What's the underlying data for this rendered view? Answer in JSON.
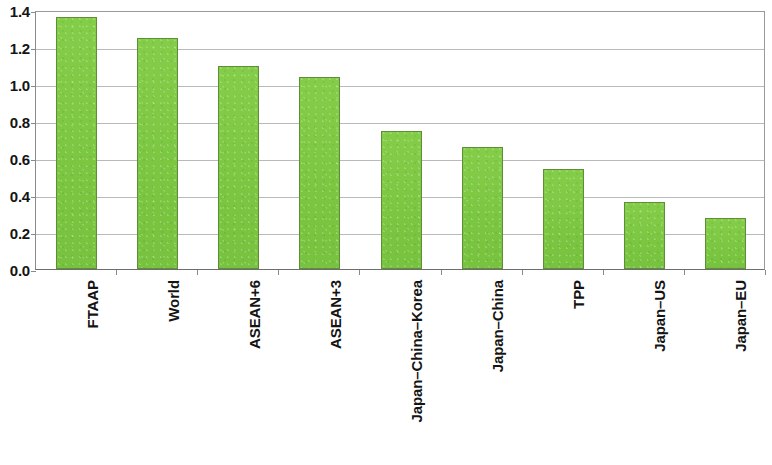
{
  "chart_data": {
    "type": "bar",
    "title": "",
    "subtitle": "",
    "xlabel": "",
    "ylabel": "",
    "categories": [
      "FTAAP",
      "World",
      "ASEAN+6",
      "ASEAN+3",
      "Japan–China–Korea",
      "Japan–China",
      "TPP",
      "Japan–US",
      "Japan–EU"
    ],
    "values": [
      1.36,
      1.25,
      1.1,
      1.04,
      0.745,
      0.66,
      0.54,
      0.36,
      0.275
    ],
    "ylim": [
      0.0,
      1.4
    ],
    "ytick_labels": [
      "0.0",
      "0.2",
      "0.4",
      "0.6",
      "0.8",
      "1.0",
      "1.2",
      "1.4"
    ],
    "ytick_values": [
      0.0,
      0.2,
      0.4,
      0.6,
      0.8,
      1.0,
      1.2,
      1.4
    ],
    "grid": true,
    "legend": false,
    "legend_position": "none",
    "bar_color": "#7ec943",
    "bar_border_color": "#5e8f36",
    "grid_color": "#b9b9b9",
    "axis_color": "#8a8a8a",
    "background_color": "#ffffff",
    "x_label_rotation_degrees": 90,
    "annotations": []
  }
}
